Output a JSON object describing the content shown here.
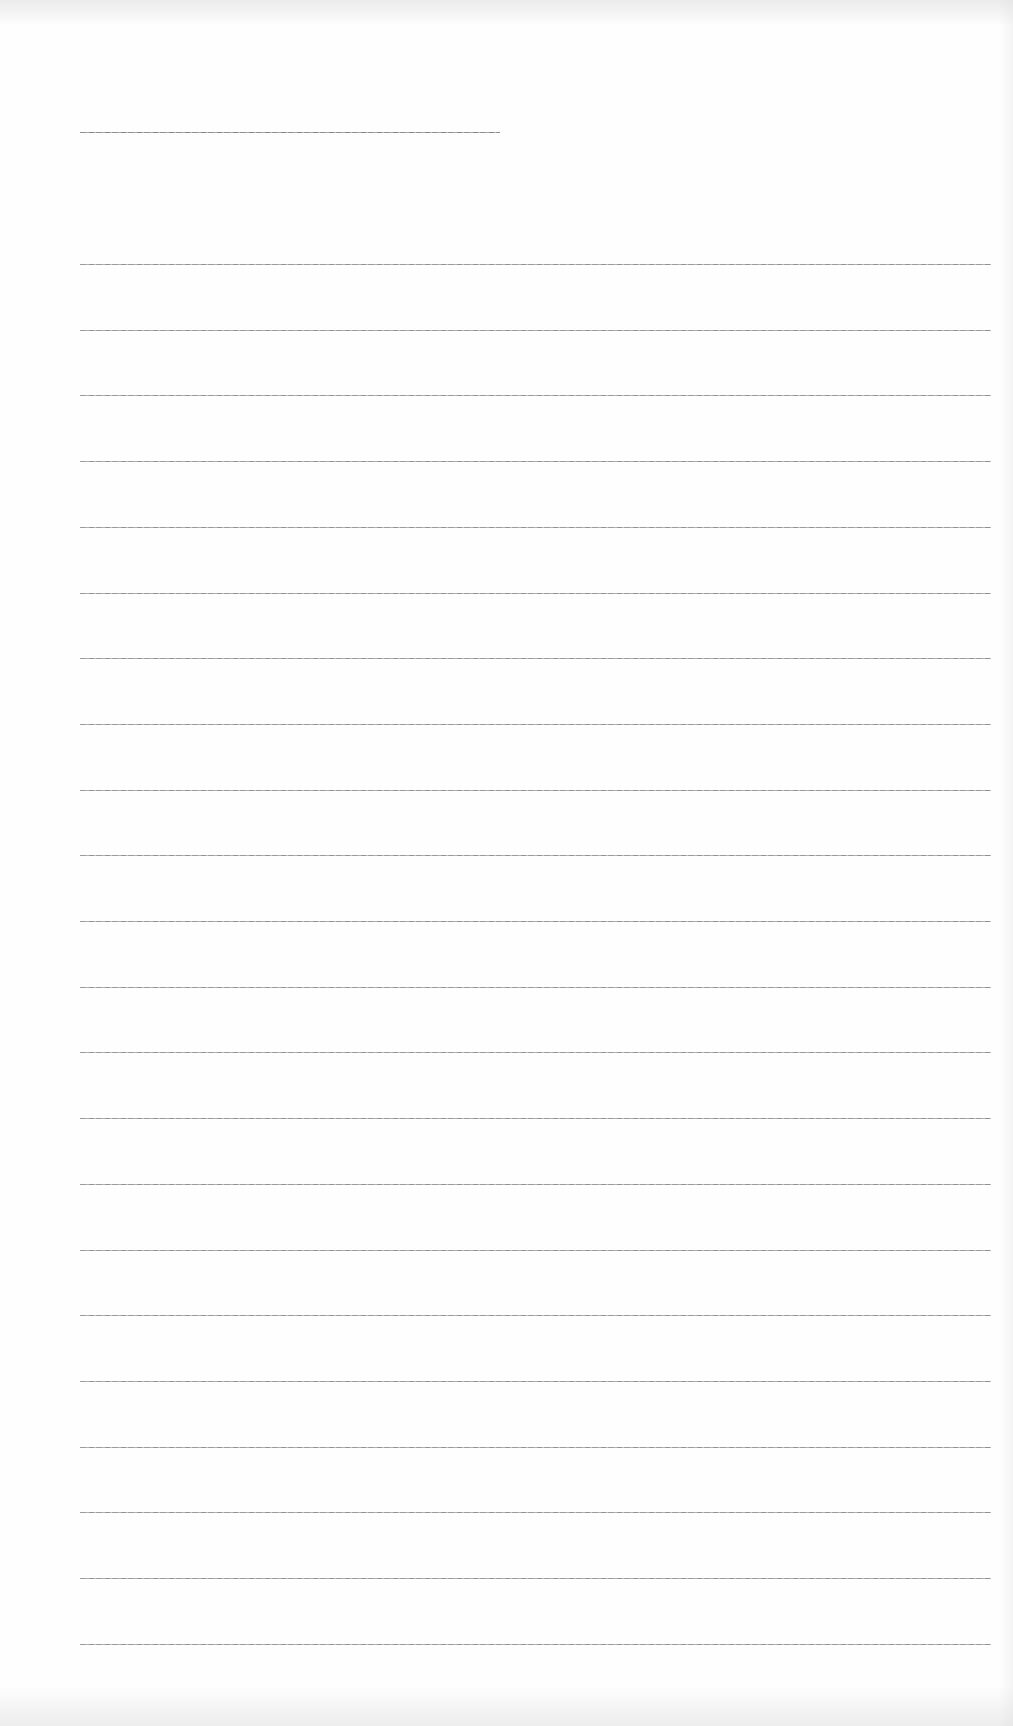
{
  "document": {
    "type": "blank ruled sheet",
    "heading_rule": {
      "x_start": 80,
      "x_end": 500,
      "y": 132
    },
    "body_rules": {
      "count": 22,
      "x_start": 80,
      "x_end": 991,
      "y_first": 264,
      "spacing": 65.7
    },
    "colors": {
      "paper": "#fefefe",
      "rule": "#8a8a8a"
    }
  }
}
